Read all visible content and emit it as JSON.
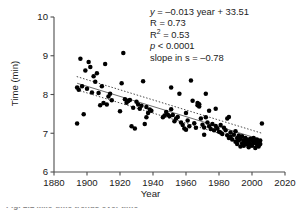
{
  "chart_data": {
    "type": "scatter",
    "title": "",
    "xlabel": "Year",
    "ylabel": "Time (min)",
    "xlim": [
      1880,
      2020
    ],
    "ylim": [
      6,
      10
    ],
    "xticks": [
      1880,
      1900,
      1920,
      1940,
      1960,
      1980,
      2000,
      2020
    ],
    "yticks": [
      6,
      7,
      8,
      9,
      10
    ],
    "grid": false,
    "legend": null,
    "marker_color": "#000000",
    "fit_line_color": "#6f6f6f",
    "band_color": "#4a4a4a",
    "annotations": {
      "equation": "y = –0.013 year + 33.51",
      "equation_italic_var": "y",
      "equation_rest": " = –0.013 year + 33.51",
      "r_label": "R = 0.73",
      "r2_base": "R",
      "r2_sup": "2",
      "r2_rest": " = 0.53",
      "p_italic": "p",
      "p_rest": " < 0.0001",
      "slope": "slope in s = –0.78"
    },
    "fit": {
      "slope_per_year": -0.013,
      "intercept": 33.51,
      "r": 0.73,
      "r_squared": 0.53,
      "p_value": "< 0.0001",
      "slope_in_seconds": -0.78,
      "x_start": 1894,
      "x_end": 2006,
      "y_start": 8.29,
      "y_end": 6.83,
      "band_offset": 0.17
    },
    "points": [
      [
        1894,
        7.25
      ],
      [
        1894,
        8.18
      ],
      [
        1895,
        8.12
      ],
      [
        1896,
        8.92
      ],
      [
        1897,
        8.21
      ],
      [
        1898,
        7.49
      ],
      [
        1899,
        8.62
      ],
      [
        1900,
        8.15
      ],
      [
        1901,
        8.84
      ],
      [
        1902,
        8.71
      ],
      [
        1903,
        8.05
      ],
      [
        1904,
        8.47
      ],
      [
        1905,
        8.33
      ],
      [
        1906,
        8.55
      ],
      [
        1907,
        8.04
      ],
      [
        1908,
        7.72
      ],
      [
        1909,
        8.21
      ],
      [
        1910,
        7.78
      ],
      [
        1911,
        8.79
      ],
      [
        1912,
        7.74
      ],
      [
        1913,
        7.95
      ],
      [
        1914,
        8.02
      ],
      [
        1915,
        7.85
      ],
      [
        1920,
        7.57
      ],
      [
        1921,
        8.29
      ],
      [
        1922,
        9.07
      ],
      [
        1923,
        7.88
      ],
      [
        1924,
        7.79
      ],
      [
        1925,
        7.83
      ],
      [
        1926,
        7.86
      ],
      [
        1927,
        7.18
      ],
      [
        1928,
        7.66
      ],
      [
        1929,
        7.12
      ],
      [
        1930,
        7.81
      ],
      [
        1931,
        7.74
      ],
      [
        1932,
        7.63
      ],
      [
        1933,
        7.71
      ],
      [
        1934,
        8.34
      ],
      [
        1935,
        7.24
      ],
      [
        1936,
        7.68
      ],
      [
        1937,
        7.52
      ],
      [
        1938,
        7.61
      ],
      [
        1939,
        7.58
      ],
      [
        1946,
        7.41
      ],
      [
        1947,
        7.46
      ],
      [
        1948,
        7.55
      ],
      [
        1949,
        7.48
      ],
      [
        1950,
        7.44
      ],
      [
        1951,
        8.18
      ],
      [
        1952,
        7.47
      ],
      [
        1953,
        7.31
      ],
      [
        1954,
        7.38
      ],
      [
        1955,
        7.42
      ],
      [
        1956,
        8.02
      ],
      [
        1957,
        7.28
      ],
      [
        1958,
        7.21
      ],
      [
        1959,
        7.12
      ],
      [
        1960,
        7.09
      ],
      [
        1961,
        7.33
      ],
      [
        1962,
        7.18
      ],
      [
        1963,
        8.36
      ],
      [
        1964,
        7.84
      ],
      [
        1965,
        7.26
      ],
      [
        1966,
        7.14
      ],
      [
        1967,
        7.72
      ],
      [
        1967,
        7.78
      ],
      [
        1968,
        7.69
      ],
      [
        1968,
        7.75
      ],
      [
        1969,
        7.38
      ],
      [
        1970,
        7.22
      ],
      [
        1971,
        7.15
      ],
      [
        1971,
        6.96
      ],
      [
        1972,
        8.02
      ],
      [
        1972,
        7.41
      ],
      [
        1973,
        7.28
      ],
      [
        1974,
        7.18
      ],
      [
        1975,
        7.11
      ],
      [
        1976,
        7.24
      ],
      [
        1977,
        7.08
      ],
      [
        1978,
        7.63
      ],
      [
        1978,
        7.19
      ],
      [
        1979,
        7.12
      ],
      [
        1980,
        7.04
      ],
      [
        1981,
        7.21
      ],
      [
        1981,
        7.02
      ],
      [
        1982,
        6.98
      ],
      [
        1983,
        7.14
      ],
      [
        1984,
        7.08
      ],
      [
        1985,
        7.38
      ],
      [
        1985,
        6.95
      ],
      [
        1986,
        6.88
      ],
      [
        1987,
        7.02
      ],
      [
        1987,
        6.91
      ],
      [
        1988,
        6.84
      ],
      [
        1989,
        6.96
      ],
      [
        1990,
        6.78
      ],
      [
        1990,
        7.05
      ],
      [
        1991,
        6.88
      ],
      [
        1991,
        6.72
      ],
      [
        1992,
        6.94
      ],
      [
        1992,
        6.81
      ],
      [
        1993,
        6.86
      ],
      [
        1993,
        6.66
      ],
      [
        1994,
        6.92
      ],
      [
        1994,
        6.74
      ],
      [
        1995,
        6.82
      ],
      [
        1995,
        6.68
      ],
      [
        1996,
        6.88
      ],
      [
        1996,
        6.76
      ],
      [
        1997,
        6.71
      ],
      [
        1997,
        6.84
      ],
      [
        1998,
        6.78
      ],
      [
        1998,
        6.64
      ],
      [
        1999,
        6.86
      ],
      [
        1999,
        6.72
      ],
      [
        2000,
        6.81
      ],
      [
        2000,
        6.68
      ],
      [
        2001,
        6.74
      ],
      [
        2001,
        6.88
      ],
      [
        2002,
        6.62
      ],
      [
        2002,
        6.79
      ],
      [
        2003,
        6.84
      ],
      [
        2003,
        6.71
      ],
      [
        2004,
        6.76
      ],
      [
        2004,
        6.66
      ],
      [
        2005,
        6.81
      ],
      [
        2005,
        6.72
      ],
      [
        2006,
        7.25
      ],
      [
        1960,
        7.52
      ],
      [
        1974,
        7.58
      ],
      [
        1986,
        7.42
      ],
      [
        1951,
        7.62
      ],
      [
        1936,
        7.41
      ]
    ]
  },
  "caption": {
    "clipped_text": "Fig. 1.1  Mile-time trends over time"
  }
}
